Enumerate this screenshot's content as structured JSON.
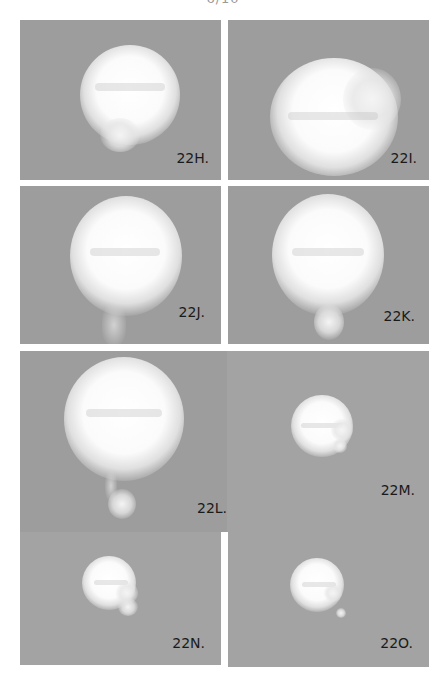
{
  "page": {
    "number_cropped": "6/10"
  },
  "figure": {
    "panels": [
      {
        "id": "22H",
        "label": "22H."
      },
      {
        "id": "22I",
        "label": "22I."
      },
      {
        "id": "22J",
        "label": "22J."
      },
      {
        "id": "22K",
        "label": "22K."
      },
      {
        "id": "22L",
        "label": "22L."
      },
      {
        "id": "22M",
        "label": "22M."
      },
      {
        "id": "22N",
        "label": "22N."
      },
      {
        "id": "22O",
        "label": "22O."
      }
    ],
    "colors": {
      "panel_bg": "#9d9d9d",
      "cell_glow": "#ffffff",
      "label_text": "#1a1a1a"
    }
  }
}
